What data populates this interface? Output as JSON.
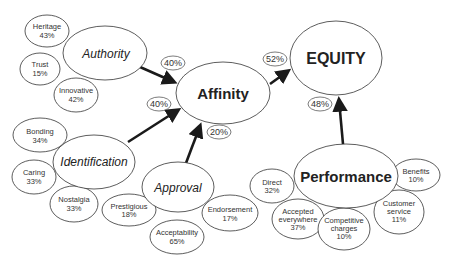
{
  "diagram": {
    "hubs": {
      "equity": {
        "label": "EQUITY"
      },
      "affinity": {
        "label": "Affinity"
      },
      "performance": {
        "label": "Performance"
      }
    },
    "drivers": {
      "authority": {
        "label": "Authority",
        "items": [
          {
            "name": "Heritage",
            "pct": "43%"
          },
          {
            "name": "Trust",
            "pct": "15%"
          },
          {
            "name": "Innovative",
            "pct": "42%"
          }
        ]
      },
      "identification": {
        "label": "Identification",
        "items": [
          {
            "name": "Bonding",
            "pct": "34%"
          },
          {
            "name": "Caring",
            "pct": "33%"
          },
          {
            "name": "Nostalgia",
            "pct": "33%"
          }
        ]
      },
      "approval": {
        "label": "Approval",
        "items": [
          {
            "name": "Prestigious",
            "pct": "18%"
          },
          {
            "name": "Acceptability",
            "pct": "65%"
          },
          {
            "name": "Endorsement",
            "pct": "17%"
          }
        ]
      },
      "performance": {
        "items": [
          {
            "name": "Direct",
            "pct": "32%"
          },
          {
            "name_line1": "Accepted",
            "name_line2": "everywhere",
            "pct": "37%"
          },
          {
            "name_line1": "Competitive",
            "name_line2": "charges",
            "pct": "10%"
          },
          {
            "name_line1": "Customer",
            "name_line2": "service",
            "pct": "11%"
          },
          {
            "name": "Benefits",
            "pct": "10%"
          }
        ]
      }
    },
    "weights": {
      "authority_to_affinity": "40%",
      "identification_to_affinity": "40%",
      "approval_to_affinity": "20%",
      "affinity_to_equity": "52%",
      "performance_to_equity": "48%"
    }
  }
}
